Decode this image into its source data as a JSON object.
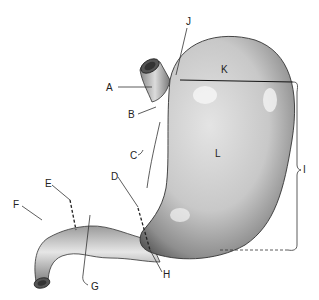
{
  "diagram": {
    "labels": [
      {
        "id": "A",
        "text": "A",
        "x": 109,
        "y": 91
      },
      {
        "id": "B",
        "text": "B",
        "x": 131,
        "y": 118
      },
      {
        "id": "C",
        "text": "C",
        "x": 132,
        "y": 155
      },
      {
        "id": "D",
        "text": "D",
        "x": 112,
        "y": 179
      },
      {
        "id": "E",
        "text": "E",
        "x": 46,
        "y": 186
      },
      {
        "id": "F",
        "text": "F",
        "x": 14,
        "y": 208
      },
      {
        "id": "G",
        "text": "G",
        "x": 92,
        "y": 290
      },
      {
        "id": "H",
        "text": "H",
        "x": 164,
        "y": 277
      },
      {
        "id": "I",
        "text": "I",
        "x": 302,
        "y": 170
      },
      {
        "id": "J",
        "text": "J",
        "x": 188,
        "y": 25
      },
      {
        "id": "K",
        "text": "K",
        "x": 222,
        "y": 72
      },
      {
        "id": "L",
        "text": "L",
        "x": 217,
        "y": 156
      }
    ]
  }
}
